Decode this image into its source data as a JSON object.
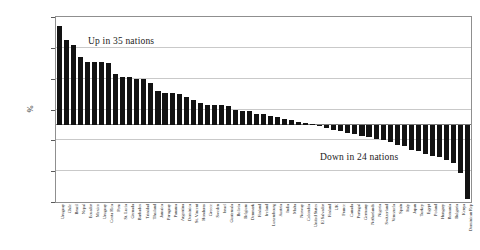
{
  "chart_data": {
    "type": "bar",
    "title": "",
    "subtitle": "",
    "xlabel": "",
    "ylabel": "%",
    "ylim": [
      -50,
      70
    ],
    "grid": true,
    "legend_position": "none",
    "yticks": [
      70,
      50,
      30,
      10,
      -10,
      -30,
      -50
    ],
    "ytick_labels": [
      "70",
      "50",
      "30",
      "10",
      "-10",
      "-30",
      "-50"
    ],
    "annotations": [
      {
        "id": "up",
        "text": "Up in 35 nations"
      },
      {
        "id": "down",
        "text": "Down in 24 nations"
      }
    ],
    "categories": [
      "Uruguay",
      "Chile",
      "Brazil",
      "Nepal",
      "Ecuador",
      "Mexico",
      "Uruguay",
      "Costa Rica",
      "Peru",
      "St. Lucia",
      "Grenada",
      "Barbados",
      "Trinidad",
      "Thailand",
      "Jamaica",
      "Paraguay",
      "Panama",
      "Argentina",
      "Dominica",
      "St. Vincent",
      "Honduras",
      "Greece",
      "Sweden",
      "Israel",
      "Guatemala",
      "Bolivia",
      "Belgium",
      "Denmark",
      "Finland",
      "Ireland",
      "Luxembourg",
      "Austria",
      "India",
      "Malta",
      "Norway",
      "Colombia",
      "United States",
      "El Salvador",
      "Finland",
      "UK",
      "France",
      "Canada",
      "Portugal",
      "Germany",
      "Netherlands",
      "Nigeria",
      "Switzerland",
      "Venezuela",
      "Spain",
      "Italy",
      "Japan",
      "Turkey",
      "Egypt",
      "Poland",
      "Hungary",
      "Romania",
      "Bulgaria",
      "Kenya",
      "Dominican Rep"
    ],
    "values": [
      64,
      55,
      52,
      44,
      41,
      41,
      41,
      40,
      33,
      31,
      31,
      30,
      30,
      27,
      22,
      21,
      21,
      20,
      18,
      16,
      14,
      13,
      13,
      13,
      12,
      10,
      9,
      9,
      7,
      7,
      6,
      5,
      4,
      3,
      2,
      1,
      0.5,
      -1,
      -2,
      -3,
      -4,
      -5,
      -6,
      -7,
      -8,
      -9,
      -10,
      -11,
      -13,
      -14,
      -16,
      -17,
      -19,
      -20,
      -21,
      -23,
      -25,
      -31,
      -48
    ]
  }
}
